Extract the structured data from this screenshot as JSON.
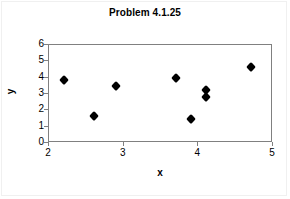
{
  "chart_data": {
    "type": "scatter",
    "title": "Problem 4.1.25",
    "xlabel": "x",
    "ylabel": "y",
    "xlim": [
      2,
      5
    ],
    "ylim": [
      0,
      6
    ],
    "xticks": [
      2,
      3,
      4,
      5
    ],
    "xtick_labels": [
      "2",
      "3",
      "4",
      "5"
    ],
    "yticks": [
      0,
      1,
      2,
      3,
      4,
      5,
      6
    ],
    "ytick_labels": [
      "0",
      "1",
      "2",
      "3",
      "4",
      "5",
      "6"
    ],
    "grid": false,
    "legend": null,
    "marker": "filled-diamond",
    "marker_color": "#000000",
    "series": [
      {
        "name": "data",
        "points": [
          {
            "x": 2.2,
            "y": 3.85
          },
          {
            "x": 2.6,
            "y": 1.65
          },
          {
            "x": 2.9,
            "y": 3.5
          },
          {
            "x": 3.7,
            "y": 3.95
          },
          {
            "x": 3.9,
            "y": 1.45
          },
          {
            "x": 4.1,
            "y": 3.25
          },
          {
            "x": 4.1,
            "y": 2.8
          },
          {
            "x": 4.7,
            "y": 4.65
          }
        ]
      }
    ]
  }
}
